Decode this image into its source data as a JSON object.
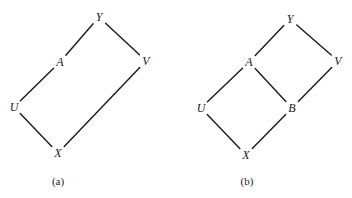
{
  "diagrams": [
    {
      "caption": "(a)",
      "nodes": [
        {
          "id": "Y",
          "label": "Y",
          "x": 99,
          "y": 17
        },
        {
          "id": "A",
          "label": "A",
          "x": 60,
          "y": 62
        },
        {
          "id": "V",
          "label": "V",
          "x": 146,
          "y": 61
        },
        {
          "id": "U",
          "label": "U",
          "x": 14,
          "y": 107
        },
        {
          "id": "X",
          "label": "X",
          "x": 58,
          "y": 153
        }
      ],
      "edges": [
        [
          "Y",
          "A"
        ],
        [
          "Y",
          "V"
        ],
        [
          "A",
          "U"
        ],
        [
          "U",
          "X"
        ],
        [
          "X",
          "V"
        ]
      ],
      "caption_pos": {
        "x": 58,
        "y": 181
      }
    },
    {
      "caption": "(b)",
      "nodes": [
        {
          "id": "Y",
          "label": "Y",
          "x": 290,
          "y": 19
        },
        {
          "id": "A",
          "label": "A",
          "x": 249,
          "y": 62
        },
        {
          "id": "V",
          "label": "V",
          "x": 338,
          "y": 61
        },
        {
          "id": "U",
          "label": "U",
          "x": 201,
          "y": 108
        },
        {
          "id": "B",
          "label": "B",
          "x": 292,
          "y": 108
        },
        {
          "id": "X",
          "label": "X",
          "x": 246,
          "y": 155
        }
      ],
      "edges": [
        [
          "Y",
          "A"
        ],
        [
          "Y",
          "V"
        ],
        [
          "A",
          "U"
        ],
        [
          "A",
          "B"
        ],
        [
          "V",
          "B"
        ],
        [
          "U",
          "X"
        ],
        [
          "B",
          "X"
        ]
      ],
      "caption_pos": {
        "x": 247,
        "y": 181
      }
    }
  ]
}
